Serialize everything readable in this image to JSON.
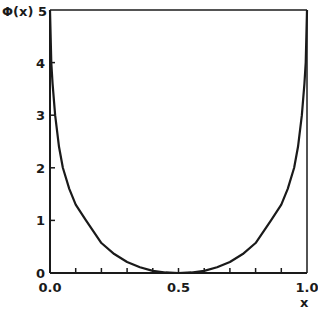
{
  "chart_data": {
    "type": "line",
    "title": "",
    "xlabel": "x",
    "ylabel": "Φ(x)",
    "xlim": [
      0.0,
      1.0
    ],
    "ylim": [
      0,
      5
    ],
    "grid": false,
    "legend": null,
    "x_ticks": [
      {
        "value": 0.0,
        "label": "0.0"
      },
      {
        "value": 0.5,
        "label": "0.5"
      },
      {
        "value": 1.0,
        "label": "1.0"
      }
    ],
    "x_minor_ticks": [
      0.1,
      0.2,
      0.3,
      0.4,
      0.6,
      0.7,
      0.8,
      0.9
    ],
    "y_ticks": [
      {
        "value": 0,
        "label": "0"
      },
      {
        "value": 1,
        "label": "1"
      },
      {
        "value": 2,
        "label": "2"
      },
      {
        "value": 3,
        "label": "3"
      },
      {
        "value": 4,
        "label": "4"
      },
      {
        "value": 5,
        "label": "5"
      }
    ],
    "series": [
      {
        "name": "Φ(x)",
        "color": "#1a1a1a",
        "x": [
          0.0,
          0.005,
          0.01,
          0.02,
          0.035,
          0.05,
          0.075,
          0.1,
          0.14,
          0.2,
          0.25,
          0.3,
          0.35,
          0.4,
          0.45,
          0.5,
          0.55,
          0.6,
          0.65,
          0.7,
          0.75,
          0.8,
          0.86,
          0.9,
          0.925,
          0.95,
          0.965,
          0.98,
          0.99,
          0.995,
          1.0
        ],
        "y": [
          5.0,
          4.0,
          3.6,
          3.0,
          2.4,
          2.0,
          1.6,
          1.3,
          1.0,
          0.57,
          0.36,
          0.21,
          0.11,
          0.04,
          0.01,
          0.0,
          0.01,
          0.04,
          0.11,
          0.21,
          0.36,
          0.57,
          1.0,
          1.3,
          1.6,
          2.0,
          2.4,
          3.0,
          3.6,
          4.0,
          5.0
        ]
      }
    ]
  },
  "axes": {
    "y_label_text": "Φ(x)",
    "x_label_text": "x"
  }
}
